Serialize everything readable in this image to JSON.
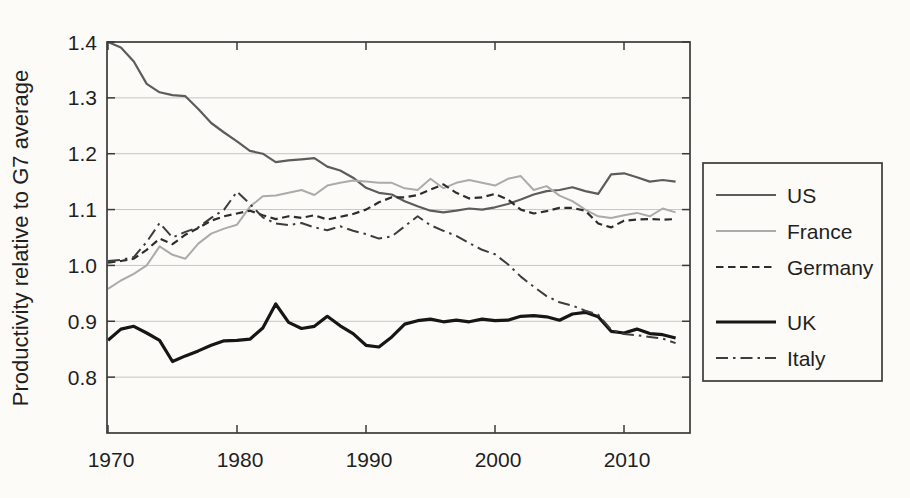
{
  "figure": {
    "background": "#fcfbf8"
  },
  "chart_data": {
    "type": "line",
    "title": "",
    "xlabel": "",
    "ylabel": "Productivity relative to G7 average",
    "xlim": [
      1969.9,
      2015.2
    ],
    "ylim": [
      0.7,
      1.4
    ],
    "grid": "horizontal",
    "grid_color": "#c6c6c6",
    "frame_color": "#3a3a3a",
    "xticks": [
      1970,
      1980,
      1990,
      2000,
      2010
    ],
    "yticks": [
      0.8,
      0.9,
      1.0,
      1.1,
      1.2,
      1.3,
      1.4
    ],
    "ytick_labels": [
      "0.8",
      "0.9",
      "1.0",
      "1.1",
      "1.2",
      "1.3",
      "1.4"
    ],
    "xtick_labels": [
      "1970",
      "1980",
      "1990",
      "2000",
      "2010"
    ],
    "legend": {
      "position": "right-outside",
      "entries": [
        "US",
        "France",
        "Germany",
        "UK",
        "Italy"
      ]
    },
    "years": [
      1970,
      1971,
      1972,
      1973,
      1974,
      1975,
      1976,
      1977,
      1978,
      1979,
      1980,
      1981,
      1982,
      1983,
      1984,
      1985,
      1986,
      1987,
      1988,
      1989,
      1990,
      1991,
      1992,
      1993,
      1994,
      1995,
      1996,
      1997,
      1998,
      1999,
      2000,
      2001,
      2002,
      2003,
      2004,
      2005,
      2006,
      2007,
      2008,
      2009,
      2010,
      2011,
      2012,
      2013,
      2014
    ],
    "series": [
      {
        "name": "US",
        "style": "solid",
        "color": "#5c5c5c",
        "width": 2.2,
        "values": [
          1.4,
          1.39,
          1.365,
          1.325,
          1.31,
          1.305,
          1.303,
          1.28,
          1.255,
          1.238,
          1.222,
          1.205,
          1.2,
          1.185,
          1.188,
          1.19,
          1.192,
          1.177,
          1.17,
          1.157,
          1.139,
          1.13,
          1.127,
          1.115,
          1.106,
          1.098,
          1.095,
          1.098,
          1.102,
          1.1,
          1.104,
          1.11,
          1.118,
          1.127,
          1.133,
          1.135,
          1.14,
          1.133,
          1.128,
          1.163,
          1.165,
          1.158,
          1.15,
          1.153,
          1.15
        ]
      },
      {
        "name": "France",
        "style": "solid",
        "color": "#ababab",
        "width": 2.0,
        "values": [
          0.958,
          0.973,
          0.985,
          1.0,
          1.034,
          1.019,
          1.012,
          1.039,
          1.057,
          1.066,
          1.073,
          1.105,
          1.124,
          1.125,
          1.13,
          1.135,
          1.126,
          1.143,
          1.148,
          1.152,
          1.15,
          1.148,
          1.148,
          1.138,
          1.135,
          1.155,
          1.138,
          1.148,
          1.153,
          1.148,
          1.143,
          1.155,
          1.16,
          1.135,
          1.142,
          1.125,
          1.115,
          1.1,
          1.088,
          1.085,
          1.09,
          1.094,
          1.088,
          1.102,
          1.095
        ]
      },
      {
        "name": "Germany",
        "style": "dashed",
        "color": "#2d2d2d",
        "width": 2.2,
        "values": [
          1.005,
          1.008,
          1.012,
          1.028,
          1.048,
          1.038,
          1.055,
          1.067,
          1.08,
          1.088,
          1.093,
          1.098,
          1.09,
          1.083,
          1.088,
          1.085,
          1.09,
          1.082,
          1.087,
          1.092,
          1.1,
          1.113,
          1.122,
          1.122,
          1.126,
          1.136,
          1.145,
          1.13,
          1.12,
          1.122,
          1.128,
          1.118,
          1.1,
          1.093,
          1.097,
          1.103,
          1.103,
          1.098,
          1.075,
          1.068,
          1.08,
          1.082,
          1.083,
          1.082,
          1.083
        ]
      },
      {
        "name": "UK",
        "style": "solid",
        "color": "#161616",
        "width": 3.2,
        "values": [
          0.866,
          0.886,
          0.891,
          0.879,
          0.866,
          0.828,
          0.838,
          0.847,
          0.857,
          0.865,
          0.866,
          0.868,
          0.888,
          0.931,
          0.898,
          0.887,
          0.891,
          0.909,
          0.892,
          0.878,
          0.857,
          0.854,
          0.872,
          0.895,
          0.901,
          0.904,
          0.899,
          0.902,
          0.899,
          0.904,
          0.901,
          0.902,
          0.909,
          0.91,
          0.908,
          0.902,
          0.913,
          0.916,
          0.908,
          0.882,
          0.879,
          0.886,
          0.878,
          0.876,
          0.87
        ]
      },
      {
        "name": "Italy",
        "style": "dashdot",
        "color": "#3d3d3d",
        "width": 2.0,
        "values": [
          1.008,
          1.01,
          1.015,
          1.042,
          1.076,
          1.05,
          1.06,
          1.068,
          1.085,
          1.1,
          1.132,
          1.11,
          1.086,
          1.075,
          1.072,
          1.076,
          1.068,
          1.063,
          1.07,
          1.062,
          1.056,
          1.048,
          1.052,
          1.07,
          1.088,
          1.072,
          1.062,
          1.053,
          1.04,
          1.028,
          1.02,
          1.002,
          0.98,
          0.962,
          0.945,
          0.934,
          0.928,
          0.919,
          0.912,
          0.885,
          0.877,
          0.875,
          0.872,
          0.869,
          0.861
        ]
      }
    ]
  }
}
